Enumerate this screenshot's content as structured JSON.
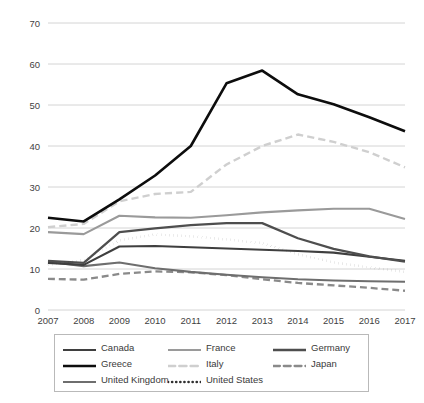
{
  "chart_data": {
    "type": "line",
    "title": "",
    "xlabel": "",
    "ylabel": "",
    "categories": [
      "2007",
      "2008",
      "2009",
      "2010",
      "2011",
      "2012",
      "2013",
      "2014",
      "2015",
      "2016",
      "2017"
    ],
    "yticks": [
      0,
      10,
      20,
      30,
      40,
      50,
      60,
      70
    ],
    "ylim": [
      0,
      70
    ],
    "grid": true,
    "legend_position": "bottom",
    "series": [
      {
        "name": "Canada",
        "color": "#3f3f3f",
        "style": "solid",
        "width": 2.1,
        "values": [
          11.5,
          11.0,
          15.5,
          15.6,
          15.3,
          15.0,
          14.7,
          14.4,
          14.0,
          13.0,
          12.0
        ]
      },
      {
        "name": "Greece",
        "color": "#0d0d0d",
        "style": "solid",
        "width": 2.6,
        "values": [
          22.5,
          21.6,
          27.0,
          32.8,
          40.0,
          55.3,
          58.4,
          52.6,
          50.2,
          47.0,
          43.6
        ]
      },
      {
        "name": "United Kingdom",
        "color": "#6e6e6e",
        "style": "solid",
        "width": 2.1,
        "values": [
          11.8,
          10.7,
          11.6,
          10.2,
          9.3,
          8.6,
          8.0,
          7.5,
          7.2,
          7.0,
          6.9
        ]
      },
      {
        "name": "France",
        "color": "#9a9a9a",
        "style": "solid",
        "width": 2.1,
        "values": [
          19.0,
          18.5,
          23.0,
          22.6,
          22.5,
          23.1,
          23.8,
          24.3,
          24.7,
          24.7,
          22.2
        ]
      },
      {
        "name": "Italy",
        "color": "#cfcfcf",
        "style": "dashed",
        "width": 2.4,
        "values": [
          20.2,
          21.0,
          26.5,
          28.3,
          28.8,
          35.5,
          40.0,
          42.8,
          41.0,
          38.5,
          34.8
        ]
      },
      {
        "name": "Germany",
        "color": "#4e4e4e",
        "style": "solid",
        "width": 2.3,
        "values": [
          12.0,
          11.5,
          19.0,
          19.9,
          20.7,
          21.2,
          21.2,
          17.5,
          14.9,
          13.1,
          11.8
        ]
      },
      {
        "name": "Japan",
        "color": "#8a8a8a",
        "style": "dashed",
        "width": 2.3,
        "values": [
          7.6,
          7.4,
          8.8,
          9.4,
          9.2,
          8.5,
          7.5,
          6.6,
          6.0,
          5.4,
          4.7
        ]
      },
      {
        "name": "United States",
        "color": "#2f2f2f",
        "style": "dotted",
        "width": 2.6,
        "values": [
          11.0,
          12.2,
          17.0,
          18.4,
          18.0,
          17.2,
          16.3,
          13.6,
          11.6,
          10.4,
          9.3
        ]
      }
    ]
  },
  "legend": {
    "items": [
      {
        "label": "Canada",
        "key": "Canada"
      },
      {
        "label": "France",
        "key": "France"
      },
      {
        "label": "Germany",
        "key": "Germany"
      },
      {
        "label": "Greece",
        "key": "Greece"
      },
      {
        "label": "Italy",
        "key": "Italy"
      },
      {
        "label": "Japan",
        "key": "Japan"
      },
      {
        "label": "United Kingdom",
        "key": "United Kingdom"
      },
      {
        "label": "United States",
        "key": "United States"
      }
    ]
  },
  "colors": {
    "grid": "#c9c9c9",
    "text": "#3a3a3a",
    "background": "#ffffff",
    "legend_border": "#b9b9b9"
  }
}
